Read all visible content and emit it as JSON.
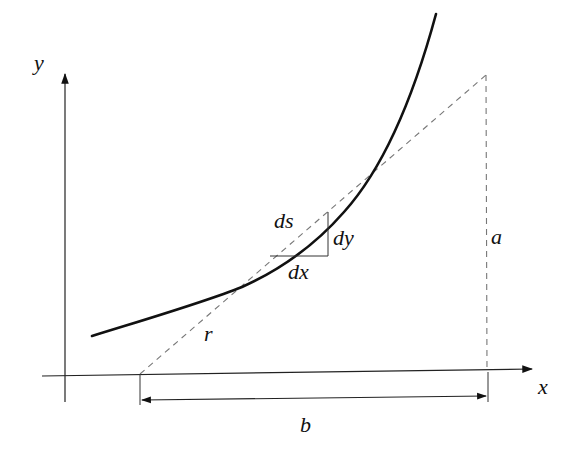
{
  "diagram": {
    "type": "geometry",
    "labels": {
      "y_axis": "y",
      "x_axis": "x",
      "arc_element": "ds",
      "dx": "dx",
      "dy": "dy",
      "height": "a",
      "base": "b",
      "radius": "r"
    },
    "colors": {
      "curve": "#111111",
      "axes": "#222222",
      "dashed": "#777777",
      "background": "#ffffff"
    }
  }
}
